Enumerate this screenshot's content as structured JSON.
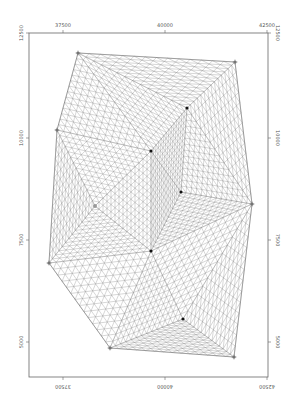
{
  "figure": {
    "type": "triangular mesh plot",
    "x_axis": {
      "ticks": [
        {
          "value": "37500",
          "px": 63
        },
        {
          "value": "40000",
          "px": 165
        },
        {
          "value": "42500",
          "px": 267
        }
      ]
    },
    "y_axis": {
      "ticks": [
        {
          "value": "12500",
          "px": 33
        },
        {
          "value": "10000",
          "px": 138
        },
        {
          "value": "7500",
          "px": 240
        },
        {
          "value": "5000",
          "px": 342
        }
      ]
    },
    "frame": {
      "left": 29,
      "top": 33,
      "right": 268,
      "bottom": 377
    },
    "boundary_vertices": [
      {
        "x": 78,
        "y": 53
      },
      {
        "x": 235,
        "y": 62
      },
      {
        "x": 252,
        "y": 204
      },
      {
        "x": 234,
        "y": 357
      },
      {
        "x": 110,
        "y": 348
      },
      {
        "x": 49,
        "y": 263
      },
      {
        "x": 57,
        "y": 130
      }
    ],
    "interior_points": [
      {
        "x": 187,
        "y": 108
      },
      {
        "x": 151,
        "y": 151
      },
      {
        "x": 181,
        "y": 192
      },
      {
        "x": 151,
        "y": 251
      },
      {
        "x": 183,
        "y": 319
      }
    ],
    "gray_point": {
      "x": 95,
      "y": 206
    },
    "colors": {
      "mesh": "#8a8a8a",
      "frame": "#666666",
      "point": "#111111",
      "vertex": "#777777"
    }
  }
}
